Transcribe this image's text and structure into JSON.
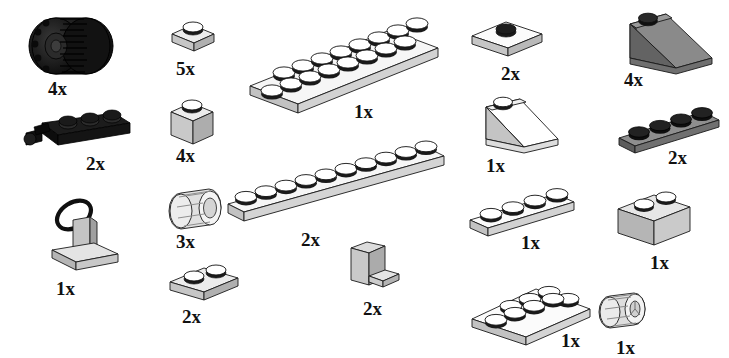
{
  "document": {
    "kind": "lego-parts-inventory",
    "background_color": "#ffffff",
    "width": 729,
    "height": 353
  },
  "palette": {
    "white_top": "#ffffff",
    "light_gray_top": "#e8e8e8",
    "light_gray_side": "#c9c9c9",
    "light_gray_front": "#b4b4b4",
    "dark_gray_top": "#8c8c8c",
    "dark_gray_side": "#6e6e6e",
    "dark_gray_front": "#5a5a5a",
    "black": "#111111",
    "stud_black": "#111111",
    "outline": "#1a1a1a",
    "text": "#111111"
  },
  "parts": [
    {
      "id": "tire",
      "name": "tire-balloon-black",
      "quantity": "4x",
      "color": "black",
      "label_x": 48,
      "label_y": 79
    },
    {
      "id": "plate-1x2-black-hinge",
      "name": "plate-1x4-with-ball-joint-black",
      "quantity": "2x",
      "color": "black",
      "label_x": 86,
      "label_y": 154
    },
    {
      "id": "antenna-on-plate",
      "name": "plate-with-steering-wheel-assembly",
      "quantity": "1x",
      "color": "light-gray",
      "label_x": 56,
      "label_y": 279
    },
    {
      "id": "brick-1x1-plate",
      "name": "plate-1x1-light-gray",
      "quantity": "5x",
      "color": "light-gray",
      "label_x": 176,
      "label_y": 59
    },
    {
      "id": "brick-1x1",
      "name": "brick-1x1-light-gray",
      "quantity": "4x",
      "color": "light-gray",
      "label_x": 176,
      "label_y": 146
    },
    {
      "id": "wheel-small",
      "name": "wheel-rim-light-gray",
      "quantity": "3x",
      "color": "light-gray",
      "label_x": 176,
      "label_y": 232
    },
    {
      "id": "plate-1x2",
      "name": "plate-1x2-light-gray",
      "quantity": "2x",
      "color": "light-gray",
      "label_x": 182,
      "label_y": 307
    },
    {
      "id": "plate-2x8",
      "name": "plate-2x8-white",
      "quantity": "1x",
      "color": "white",
      "label_x": 354,
      "label_y": 102
    },
    {
      "id": "plate-1x10",
      "name": "plate-1x10-white",
      "quantity": "2x",
      "color": "white",
      "label_x": 301,
      "label_y": 230
    },
    {
      "id": "bracket",
      "name": "bracket-1x2-1x2-light-gray",
      "quantity": "2x",
      "color": "light-gray",
      "label_x": 363,
      "label_y": 299
    },
    {
      "id": "plate-1x2-jumper",
      "name": "plate-1x2-with-center-stud-white",
      "quantity": "2x",
      "color": "white",
      "label_x": 501,
      "label_y": 64
    },
    {
      "id": "slope-1x3-white",
      "name": "slope-33-1x3-white",
      "quantity": "1x",
      "color": "white",
      "label_x": 486,
      "label_y": 156
    },
    {
      "id": "plate-1x4-white",
      "name": "plate-1x4-white",
      "quantity": "1x",
      "color": "white",
      "label_x": 521,
      "label_y": 233
    },
    {
      "id": "plate-2x4-white",
      "name": "plate-2x4-white",
      "quantity": "1x",
      "color": "white",
      "label_x": 561,
      "label_y": 331
    },
    {
      "id": "slope-1x3-dark",
      "name": "slope-33-1x3-dark-gray",
      "quantity": "4x",
      "color": "dark-gray",
      "label_x": 624,
      "label_y": 70
    },
    {
      "id": "plate-1x4-dark",
      "name": "plate-1x4-dark-gray",
      "quantity": "2x",
      "color": "dark-gray",
      "label_x": 668,
      "label_y": 148
    },
    {
      "id": "brick-1x2",
      "name": "brick-1x2-light-gray",
      "quantity": "1x",
      "color": "light-gray",
      "label_x": 650,
      "label_y": 253
    },
    {
      "id": "wheel-rim-small",
      "name": "wheel-rim-small-light-gray",
      "quantity": "1x",
      "color": "light-gray",
      "label_x": 616,
      "label_y": 338
    }
  ]
}
